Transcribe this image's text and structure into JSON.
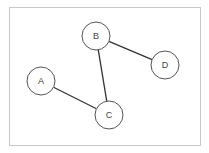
{
  "diagram": {
    "type": "graph",
    "frame": {
      "x": 9,
      "y": 7,
      "width": 191,
      "height": 138,
      "stroke": "#c8c8c8"
    },
    "node_radius": 14,
    "node_stroke": "#555555",
    "edge_stroke": "#333333",
    "nodes": [
      {
        "id": "A",
        "label": "A",
        "x": 41,
        "y": 81
      },
      {
        "id": "B",
        "label": "B",
        "x": 96,
        "y": 36
      },
      {
        "id": "C",
        "label": "C",
        "x": 109,
        "y": 115
      },
      {
        "id": "D",
        "label": "D",
        "x": 165,
        "y": 65
      }
    ],
    "edges": [
      {
        "from": "A",
        "to": "C"
      },
      {
        "from": "B",
        "to": "C"
      },
      {
        "from": "B",
        "to": "D"
      }
    ]
  }
}
